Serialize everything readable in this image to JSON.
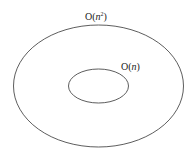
{
  "diagram": {
    "type": "nested-sets",
    "outer_set": {
      "label_prefix": "O(",
      "label_var": "n",
      "label_sup": "2",
      "label_suffix": ")",
      "label_full": "O(n^2)",
      "cx": 98.5,
      "cy": 86,
      "rx": 85,
      "ry": 61
    },
    "inner_set": {
      "label_prefix": "O(",
      "label_var": "n",
      "label_suffix": ")",
      "label_full": "O(n)",
      "cx": 98.5,
      "cy": 86,
      "rx": 30,
      "ry": 17
    },
    "stroke_color": "#333333",
    "background": "#ffffff"
  }
}
